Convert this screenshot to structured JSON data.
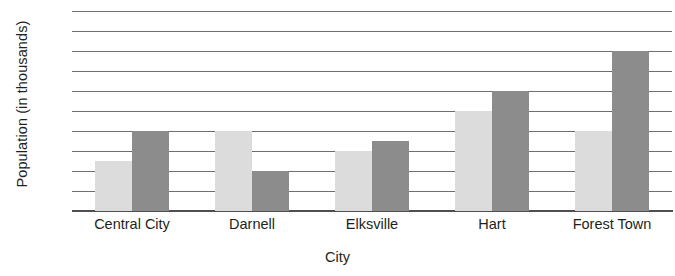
{
  "chart_data": {
    "type": "bar",
    "title": "",
    "xlabel": "City",
    "ylabel": "Population (in thousands)",
    "categories": [
      "Central City",
      "Darnell",
      "Elksville",
      "Hart",
      "Forest Town"
    ],
    "series": [
      {
        "name": "series-1",
        "color": "#dcdcdc",
        "values": [
          25,
          40,
          30,
          50,
          40
        ]
      },
      {
        "name": "series-2",
        "color": "#8c8c8c",
        "values": [
          40,
          20,
          35,
          60,
          80
        ]
      }
    ],
    "ylim": [
      0,
      100
    ],
    "yticks": [
      100,
      90,
      80,
      70,
      60,
      50,
      40,
      30,
      20,
      10,
      0
    ],
    "ytick_labels": [
      "100",
      "90",
      "80",
      "70",
      "60",
      "50",
      "40",
      "30",
      "20",
      "10",
      "0"
    ],
    "grid": true,
    "legend": "none",
    "orientation": "vertical",
    "grouping": "grouped"
  },
  "colors": {
    "grid": "#6d6e71",
    "axis": "#4d4f53",
    "text": "#231f20",
    "background": "#ffffff"
  }
}
